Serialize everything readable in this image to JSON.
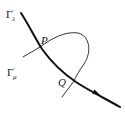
{
  "diagram": {
    "type": "curve-intersection",
    "curves": [
      {
        "id": "gamma_lambda",
        "label_main": "Γ",
        "label_prime": "′",
        "label_sub": "λ",
        "style": "thick",
        "directed": true,
        "color": "#111111"
      },
      {
        "id": "gamma_mu",
        "label_main": "Γ",
        "label_prime": "′",
        "label_sub": "μ",
        "style": "thin",
        "directed": false,
        "color": "#333333"
      }
    ],
    "points": [
      {
        "id": "P",
        "label": "P"
      },
      {
        "id": "Q",
        "label": "Q"
      }
    ]
  }
}
